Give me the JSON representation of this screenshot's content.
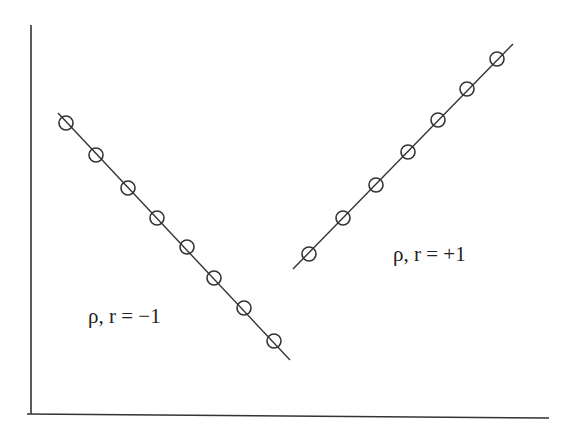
{
  "chart_data": {
    "type": "scatter",
    "title": "",
    "xlabel": "",
    "ylabel": "",
    "grid": false,
    "legend": null,
    "axes": {
      "x_ticks": [],
      "y_ticks": [],
      "note": "Axes drawn without ticks or tick labels"
    },
    "series": [
      {
        "name": "negative correlation",
        "annotation": "ρ, r = −1",
        "marker": "open-circle",
        "fit_line": true,
        "points_px": [
          [
            66,
            123
          ],
          [
            96,
            155
          ],
          [
            128,
            188
          ],
          [
            157,
            218
          ],
          [
            187,
            247
          ],
          [
            214,
            278
          ],
          [
            244,
            308
          ],
          [
            274,
            341
          ]
        ],
        "line_px": [
          [
            58,
            113
          ],
          [
            290,
            360
          ]
        ],
        "label_px": [
          88,
          306
        ]
      },
      {
        "name": "positive correlation",
        "annotation": "ρ, r = +1",
        "marker": "open-circle",
        "fit_line": true,
        "points_px": [
          [
            309,
            254
          ],
          [
            343,
            218
          ],
          [
            376,
            185
          ],
          [
            408,
            152
          ],
          [
            438,
            120
          ],
          [
            467,
            89
          ],
          [
            497,
            59
          ]
        ],
        "line_px": [
          [
            293,
            269
          ],
          [
            513,
            44
          ]
        ],
        "label_px": [
          393,
          244
        ]
      }
    ],
    "axes_px": {
      "y_axis": [
        [
          31,
          25
        ],
        [
          31,
          414
        ]
      ],
      "x_axis": [
        [
          27,
          414
        ],
        [
          549,
          418
        ]
      ]
    }
  },
  "labels": {
    "negative": "ρ, r = −1",
    "positive": "ρ, r = +1"
  },
  "style": {
    "stroke": "#333333",
    "marker_radius": 7
  }
}
